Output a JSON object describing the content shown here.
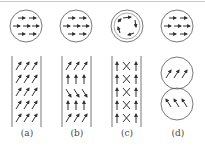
{
  "figure": {
    "panels": [
      {
        "id": "a",
        "label": "(a)",
        "top": "circle-uniform-horizontal",
        "bottom": "column-uniform-tilted-right"
      },
      {
        "id": "b",
        "label": "(b)",
        "top": "circle-uniform-horizontal",
        "bottom": "column-alternating-tilt-vertical"
      },
      {
        "id": "c",
        "label": "(c)",
        "top": "circle-vortex-arrows",
        "bottom": "column-vertical-with-crosses"
      },
      {
        "id": "d",
        "label": "(d)",
        "top": "circle-uniform-horizontal",
        "bottom": "two-circles-opposite-tilt"
      }
    ]
  },
  "colors": {
    "stroke": "#555555",
    "arrow": "#333333",
    "label": "#444444",
    "topline": "#c8c8c8"
  }
}
